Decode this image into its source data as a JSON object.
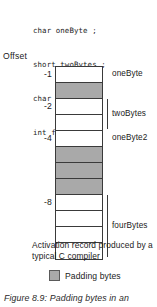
{
  "code": {
    "lines": [
      "char oneByte ;",
      "short twoBytes ;",
      "char oneByte2 ;",
      "int fourBytes ;"
    ]
  },
  "diagram": {
    "offset_label": "Offset",
    "ticks": [
      {
        "label": "-1",
        "row": 0
      },
      {
        "label": "-2",
        "row": 2
      },
      {
        "label": "-4",
        "row": 4
      },
      {
        "label": "-8",
        "row": 8
      }
    ],
    "cells": [
      {
        "kind": "data",
        "field": "oneByte"
      },
      {
        "kind": "padding",
        "field": ""
      },
      {
        "kind": "data",
        "field": "twoBytes"
      },
      {
        "kind": "data",
        "field": ""
      },
      {
        "kind": "data",
        "field": "oneByte2"
      },
      {
        "kind": "padding",
        "field": ""
      },
      {
        "kind": "padding",
        "field": ""
      },
      {
        "kind": "padding",
        "field": ""
      },
      {
        "kind": "data",
        "field": "fourBytes"
      },
      {
        "kind": "data",
        "field": ""
      },
      {
        "kind": "data",
        "field": ""
      },
      {
        "kind": "data",
        "field": ""
      }
    ],
    "fields": [
      {
        "label": "oneByte",
        "row": 0,
        "span": 1,
        "bracket": false
      },
      {
        "label": "twoBytes",
        "row": 2,
        "span": 2,
        "bracket": true
      },
      {
        "label": "oneByte2",
        "row": 4,
        "span": 1,
        "bracket": false
      },
      {
        "label": "fourBytes",
        "row": 8,
        "span": 4,
        "bracket": true
      }
    ]
  },
  "record_caption": "Activation record produced by a typical C compiler",
  "legend": {
    "swatch_color": "#a9a9a9",
    "label": "Padding bytes"
  },
  "figure_caption": "Figure 8.9: Padding bytes in an"
}
